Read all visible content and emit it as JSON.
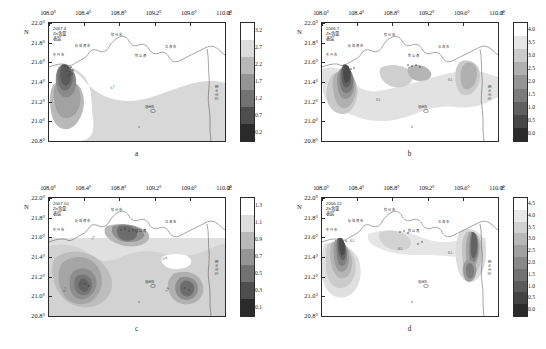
{
  "figure": {
    "panels": [
      {
        "key": "a",
        "letter": "a",
        "annotation": "2007.4\nZn含量\n表层",
        "date": "2007.4",
        "variable": "Zn含量",
        "layer": "表层"
      },
      {
        "key": "b",
        "letter": "b",
        "annotation": "2006.7\nZn含量\n表层",
        "date": "2006.7",
        "variable": "Zn含量",
        "layer": "表层"
      },
      {
        "key": "c",
        "letter": "c",
        "annotation": "2007.10\nZn含量\n表层",
        "date": "2007.10",
        "variable": "Zn含量",
        "layer": "表层"
      },
      {
        "key": "d",
        "letter": "d",
        "annotation": "2006.12\nZn含量\n表层",
        "date": "2006.12",
        "variable": "Zn含量",
        "layer": "表层"
      }
    ],
    "axis": {
      "x_ticks": [
        "108.0°",
        "108.4°",
        "108.8°",
        "109.2°",
        "109.6°",
        "110.0°"
      ],
      "x_unit": "E",
      "y_ticks": [
        "22.0°",
        "21.8°",
        "21.6°",
        "21.4°",
        "21.2°",
        "21.0°",
        "20.8°"
      ],
      "y_unit": "N"
    },
    "map_labels": {
      "a": [
        "钦州市",
        "防城港市",
        "东兴市",
        "北海市",
        "铁山港",
        "涠洲岛",
        "雷州半岛"
      ],
      "b": [
        "钦州市",
        "防城港市",
        "东兴市",
        "北海市",
        "铁山港",
        "涠洲岛",
        "雷州半岛"
      ],
      "c": [
        "钦州市",
        "防城港市",
        "东兴市",
        "北海市",
        "铁山港",
        "涠洲岛",
        "雷州半岛"
      ],
      "d": [
        "钦州市",
        "防城港市",
        "东兴市",
        "北海市",
        "铁山港",
        "涠洲岛",
        "雷州半岛"
      ]
    }
  },
  "chart_data": [
    {
      "type": "heatmap",
      "panel": "a",
      "title": "2007.4 Zn含量 表层",
      "xlabel": "E",
      "ylabel": "N",
      "xlim": [
        108.0,
        110.0
      ],
      "ylim": [
        20.8,
        22.0
      ],
      "xticks": [
        108.0,
        108.4,
        108.8,
        109.2,
        109.6,
        110.0
      ],
      "yticks": [
        20.8,
        21.0,
        21.2,
        21.4,
        21.6,
        21.8,
        22.0
      ],
      "colorbar_ticks": [
        0.2,
        0.7,
        1.2,
        1.7,
        2.2,
        2.7,
        3.2
      ],
      "colorbar_min": 0.2,
      "colorbar_max": 3.2,
      "contour_levels": [
        0.2,
        0.7,
        1.2,
        1.7,
        2.2,
        2.7,
        3.2
      ],
      "contour_labels": [
        "0.7"
      ],
      "grid": false,
      "legend": "colorbar-right",
      "maxima": [
        {
          "lon": 108.12,
          "lat": 21.46,
          "value": 3.2
        }
      ]
    },
    {
      "type": "heatmap",
      "panel": "b",
      "title": "2006.7 Zn含量 表层",
      "xlabel": "E",
      "ylabel": "N",
      "xlim": [
        108.0,
        110.0
      ],
      "ylim": [
        20.8,
        22.0
      ],
      "xticks": [
        108.0,
        108.4,
        108.8,
        109.2,
        109.6,
        110.0
      ],
      "yticks": [
        20.8,
        21.0,
        21.2,
        21.4,
        21.6,
        21.8,
        22.0
      ],
      "colorbar_ticks": [
        0.0,
        0.5,
        1.0,
        1.5,
        2.0,
        2.5,
        3.0,
        3.5,
        4.0
      ],
      "colorbar_min": 0.0,
      "colorbar_max": 4.0,
      "contour_levels": [
        0.0,
        0.5,
        1.0,
        1.5,
        2.0,
        2.5,
        3.0,
        3.5,
        4.0
      ],
      "contour_labels": [
        "0.5",
        "0.5"
      ],
      "grid": false,
      "legend": "colorbar-right",
      "maxima": [
        {
          "lon": 108.45,
          "lat": 21.52,
          "value": 4.0
        }
      ]
    },
    {
      "type": "heatmap",
      "panel": "c",
      "title": "2007.10 Zn含量 表层",
      "xlabel": "E",
      "ylabel": "N",
      "xlim": [
        108.0,
        110.0
      ],
      "ylim": [
        20.8,
        22.0
      ],
      "xticks": [
        108.0,
        108.4,
        108.8,
        109.2,
        109.6,
        110.0
      ],
      "yticks": [
        20.8,
        21.0,
        21.2,
        21.4,
        21.6,
        21.8,
        22.0
      ],
      "colorbar_ticks": [
        0.1,
        0.3,
        0.5,
        0.7,
        0.9,
        1.1,
        1.3
      ],
      "colorbar_min": 0.1,
      "colorbar_max": 1.3,
      "contour_levels": [
        0.1,
        0.3,
        0.5,
        0.7,
        0.9,
        1.1,
        1.3
      ],
      "contour_labels": [
        "0.5",
        "0.7",
        "0.9",
        "0.9"
      ],
      "grid": false,
      "legend": "colorbar-right",
      "maxima": [
        {
          "lon": 108.72,
          "lat": 21.08,
          "value": 1.3
        },
        {
          "lon": 109.52,
          "lat": 21.07,
          "value": 1.3
        },
        {
          "lon": 109.0,
          "lat": 21.58,
          "value": 1.1
        }
      ]
    },
    {
      "type": "heatmap",
      "panel": "d",
      "title": "2006.12 Zn含量 表层",
      "xlabel": "E",
      "ylabel": "N",
      "xlim": [
        108.0,
        110.0
      ],
      "ylim": [
        20.8,
        22.0
      ],
      "xticks": [
        108.0,
        108.4,
        108.8,
        109.2,
        109.6,
        110.0
      ],
      "yticks": [
        20.8,
        21.0,
        21.2,
        21.4,
        21.6,
        21.8,
        22.0
      ],
      "colorbar_ticks": [
        0.0,
        0.5,
        1.0,
        1.5,
        2.0,
        2.5,
        3.0,
        3.5,
        4.0,
        4.5
      ],
      "colorbar_min": 0.0,
      "colorbar_max": 4.5,
      "contour_levels": [
        0.0,
        0.5,
        1.0,
        1.5,
        2.0,
        2.5,
        3.0,
        3.5,
        4.0,
        4.5
      ],
      "contour_labels": [
        "0.5",
        "0.5",
        "0.5"
      ],
      "grid": false,
      "legend": "colorbar-right",
      "maxima": [
        {
          "lon": 108.38,
          "lat": 21.47,
          "value": 4.5
        },
        {
          "lon": 109.62,
          "lat": 21.5,
          "value": 4.0
        }
      ]
    }
  ]
}
